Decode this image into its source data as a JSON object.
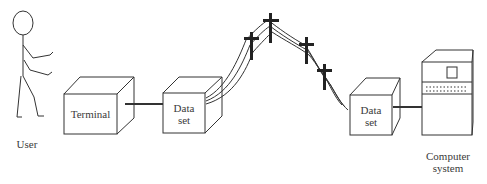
{
  "diagram": {
    "nodes": {
      "user": {
        "label": "User"
      },
      "terminal": {
        "label": "Terminal"
      },
      "dataset_left": {
        "line1": "Data",
        "line2": "set"
      },
      "dataset_right": {
        "line1": "Data",
        "line2": "set"
      },
      "computer": {
        "line1": "Computer",
        "line2": "system"
      }
    },
    "telephone_poles": 4,
    "colors": {
      "stroke": "#333333",
      "pole": "#222222",
      "background": "#ffffff"
    }
  }
}
